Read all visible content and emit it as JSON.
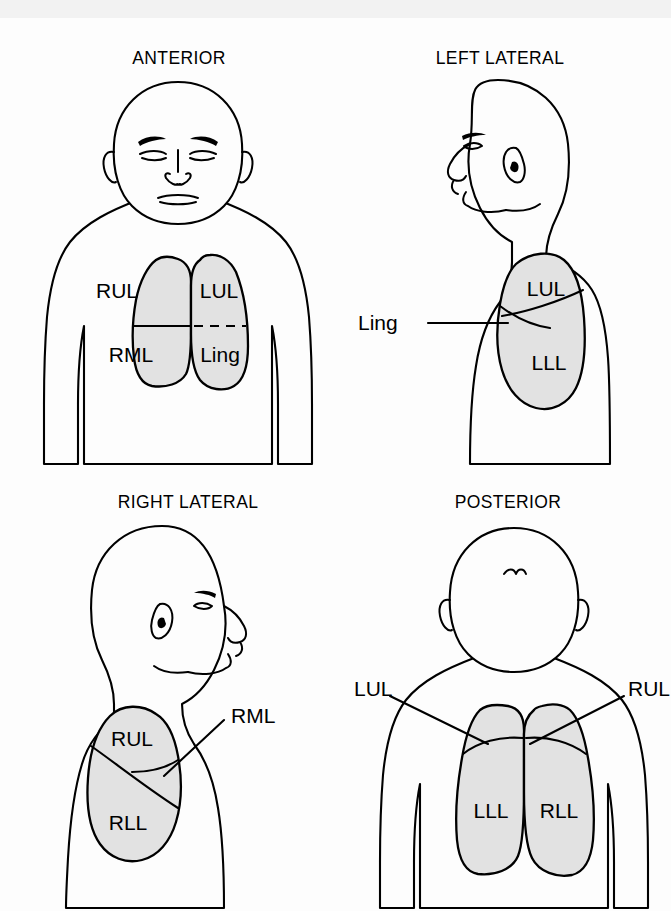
{
  "document": {
    "kind": "anatomical-illustration",
    "subject": "Lung lobe surface projections in four body views",
    "background_color": "#fdfdfd",
    "ink_color": "#000000",
    "lung_fill_color": "#e2e2e2"
  },
  "panels": [
    {
      "id": "anterior",
      "title": "ANTERIOR",
      "view_description": "Front-facing figure, head and upper torso",
      "lobes": [
        {
          "abbr": "RUL",
          "side": "right",
          "x": 83,
          "y": 148
        },
        {
          "abbr": "RML",
          "side": "right",
          "x": 79,
          "y": 215
        },
        {
          "abbr": "LUL",
          "side": "left",
          "x": 153,
          "y": 148
        },
        {
          "abbr": "Ling",
          "side": "left",
          "x": 150,
          "y": 215
        }
      ],
      "fissures": [
        {
          "between": "RUL-RML",
          "style": "solid"
        },
        {
          "between": "LUL-Ling",
          "style": "dashed"
        }
      ],
      "callouts": []
    },
    {
      "id": "left-lateral",
      "title": "LEFT LATERAL",
      "view_description": "Side profile facing left, left chest wall shown",
      "lobes": [
        {
          "abbr": "LUL",
          "side": "left",
          "x": 140,
          "y": 160
        },
        {
          "abbr": "LLL",
          "side": "left",
          "x": 148,
          "y": 228
        }
      ],
      "fissures": [
        {
          "between": "LUL-LLL",
          "style": "solid"
        },
        {
          "between": "Ling-wedge",
          "style": "solid"
        }
      ],
      "callouts": [
        {
          "abbr": "Ling",
          "label_x": 10,
          "label_y": 206,
          "target_x": 118,
          "target_y": 200
        }
      ]
    },
    {
      "id": "right-lateral",
      "title": "RIGHT LATERAL",
      "view_description": "Side profile facing right, right chest wall shown",
      "lobes": [
        {
          "abbr": "RUL",
          "side": "right",
          "x": 88,
          "y": 172
        },
        {
          "abbr": "RLL",
          "side": "right",
          "x": 87,
          "y": 258
        }
      ],
      "fissures": [
        {
          "between": "RUL-RLL",
          "style": "solid"
        },
        {
          "between": "RML-wedge",
          "style": "solid"
        }
      ],
      "callouts": [
        {
          "abbr": "RML",
          "label_x": 196,
          "label_y": 196,
          "target_x": 163,
          "target_y": 216
        }
      ]
    },
    {
      "id": "posterior",
      "title": "POSTERIOR",
      "view_description": "Back-facing figure, head and upper back",
      "lobes": [
        {
          "abbr": "LLL",
          "side": "left",
          "x": 76,
          "y": 250
        },
        {
          "abbr": "RLL",
          "side": "right",
          "x": 150,
          "y": 250
        }
      ],
      "fissures": [
        {
          "between": "LUL-LLL",
          "style": "solid"
        },
        {
          "between": "RUL-RLL",
          "style": "solid"
        }
      ],
      "callouts": [
        {
          "abbr": "LUL",
          "label_x": 4,
          "label_y": 166,
          "target_x": 97,
          "target_y": 197
        },
        {
          "abbr": "RUL",
          "label_x": 239,
          "label_y": 166,
          "target_x": 140,
          "target_y": 197
        }
      ]
    }
  ],
  "legend_terms": {
    "RUL": "Right upper lobe",
    "RML": "Right middle lobe",
    "RLL": "Right lower lobe",
    "LUL": "Left upper lobe",
    "LLL": "Left lower lobe",
    "Ling": "Lingula"
  }
}
